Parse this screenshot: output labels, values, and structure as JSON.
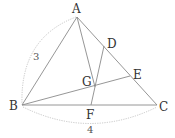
{
  "diagram": {
    "type": "triangle-geometry",
    "points": {
      "A": {
        "label": "A",
        "x": 77,
        "y": 17
      },
      "B": {
        "label": "B",
        "x": 22,
        "y": 105
      },
      "C": {
        "label": "C",
        "x": 157,
        "y": 105
      },
      "D": {
        "label": "D",
        "x": 104,
        "y": 46
      },
      "E": {
        "label": "E",
        "x": 130,
        "y": 76
      },
      "F": {
        "label": "F",
        "x": 91,
        "y": 105
      },
      "G": {
        "label": "G",
        "x": 95,
        "y": 87
      }
    },
    "segments": [
      [
        "A",
        "B"
      ],
      [
        "B",
        "C"
      ],
      [
        "A",
        "C"
      ],
      [
        "A",
        "G"
      ],
      [
        "B",
        "E"
      ],
      [
        "D",
        "F"
      ]
    ],
    "measurements": {
      "AB": "3",
      "BC": "4"
    }
  }
}
